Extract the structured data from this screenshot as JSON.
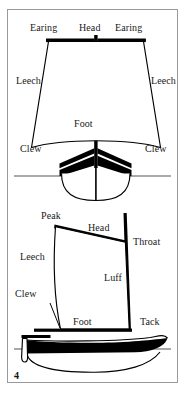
{
  "figure": {
    "number": "4",
    "border_color": "#9a9a9a",
    "background": "#ffffff",
    "ink_color": "#000000",
    "waterline_color": "#8c8c8c"
  },
  "diagram_top": {
    "name": "square-sail-front-view",
    "labels": {
      "earing_left": "Earing",
      "head": "Head",
      "earing_right": "Earing",
      "leech_left": "Leech",
      "leech_right": "Leech",
      "foot": "Foot",
      "clew_left": "Clew",
      "clew_right": "Clew"
    }
  },
  "diagram_bottom": {
    "name": "gaff-sail-side-view",
    "labels": {
      "peak": "Peak",
      "head": "Head",
      "throat": "Throat",
      "leech": "Leech",
      "luff": "Luff",
      "clew": "Clew",
      "foot": "Foot",
      "tack": "Tack"
    }
  }
}
